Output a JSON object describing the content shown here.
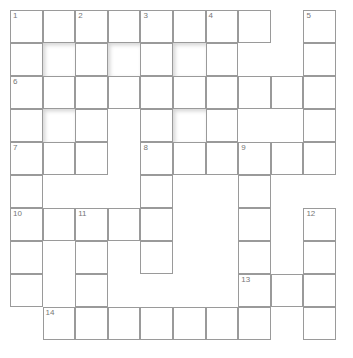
{
  "puzzle": {
    "type": "crossword",
    "rows": 10,
    "cols": 10,
    "cell_size": 32.6,
    "colors": {
      "cell_bg": "#ffffff",
      "border": "#9a9a9a",
      "number": "#777777"
    },
    "layout": [
      "CCCCCCCC.C",
      "CBCBCBC..C",
      "CCCCCCCCCC",
      "CBC.CBC..C",
      "CCC.CCCCCC",
      "C...C..C..",
      "CCCCC..C.C",
      "C.C.C..C.C",
      "C.C....CCC",
      ".CCCCCCC.C"
    ],
    "numbers": [
      {
        "n": "1",
        "r": 0,
        "c": 0
      },
      {
        "n": "2",
        "r": 0,
        "c": 2
      },
      {
        "n": "3",
        "r": 0,
        "c": 4
      },
      {
        "n": "4",
        "r": 0,
        "c": 6
      },
      {
        "n": "5",
        "r": 0,
        "c": 9
      },
      {
        "n": "6",
        "r": 2,
        "c": 0
      },
      {
        "n": "7",
        "r": 4,
        "c": 0
      },
      {
        "n": "8",
        "r": 4,
        "c": 4
      },
      {
        "n": "9",
        "r": 4,
        "c": 7
      },
      {
        "n": "10",
        "r": 6,
        "c": 0
      },
      {
        "n": "11",
        "r": 6,
        "c": 2
      },
      {
        "n": "12",
        "r": 6,
        "c": 9
      },
      {
        "n": "13",
        "r": 8,
        "c": 7
      },
      {
        "n": "14",
        "r": 9,
        "c": 1
      }
    ]
  }
}
